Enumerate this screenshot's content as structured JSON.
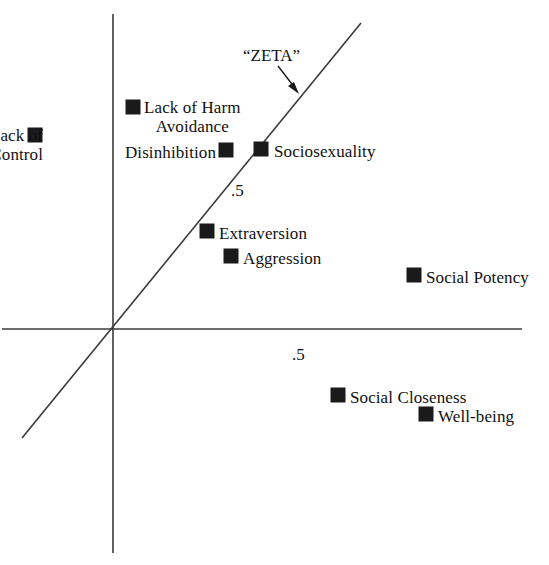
{
  "chart_data": {
    "type": "scatter",
    "title": "",
    "subtitle": "",
    "xlabel": "",
    "ylabel": "",
    "grid": false,
    "legend_position": "none",
    "axes": {
      "style": "crossed-axes-at-origin",
      "origin_px": [
        112,
        329
      ],
      "x_axis_px": [
        [
          2,
          329
        ],
        [
          522,
          329
        ]
      ],
      "y_axis_px": [
        [
          113,
          14
        ],
        [
          113,
          553
        ]
      ],
      "x_ticks": [
        {
          "label": ".5",
          "px": [
            292,
            346
          ]
        }
      ],
      "y_ticks": [
        {
          "label": ".5",
          "px": [
            231,
            182
          ]
        }
      ]
    },
    "annotations": [
      {
        "name": "zeta-axis-line",
        "kind": "line",
        "label": "“ZETA”",
        "from_px": [
          22,
          438
        ],
        "to_px": [
          361,
          23
        ],
        "arrow_from_px": [
          278,
          66
        ],
        "arrow_to_px": [
          299,
          93
        ],
        "label_px": [
          243,
          46
        ]
      }
    ],
    "points": [
      {
        "name": "lack-of-control",
        "label": "Lack of\nControl",
        "marker_px": [
          28,
          128
        ],
        "label_px": [
          43,
          126
        ],
        "label_side": "right",
        "label_align": "right"
      },
      {
        "name": "lack-of-harm-avoidance",
        "label": "Lack of Harm\nAvoidance",
        "marker_px": [
          126,
          100
        ],
        "label_px": [
          144,
          98
        ],
        "label_side": "right",
        "label_align": "center"
      },
      {
        "name": "disinhibition",
        "label": "Disinhibition",
        "marker_px": [
          219,
          143
        ],
        "label_px": [
          216,
          143
        ],
        "label_side": "left",
        "label_align": "right"
      },
      {
        "name": "sociosexuality",
        "label": "Sociosexuality",
        "marker_px": [
          254,
          142
        ],
        "label_px": [
          274,
          142
        ],
        "label_side": "right",
        "label_align": "left"
      },
      {
        "name": "extraversion",
        "label": "Extraversion",
        "marker_px": [
          200,
          224
        ],
        "label_px": [
          219,
          224
        ],
        "label_side": "right",
        "label_align": "left"
      },
      {
        "name": "aggression",
        "label": "Aggression",
        "marker_px": [
          224,
          249
        ],
        "label_px": [
          243,
          249
        ],
        "label_side": "right",
        "label_align": "left"
      },
      {
        "name": "social-potency",
        "label": "Social Potency",
        "marker_px": [
          407,
          268
        ],
        "label_px": [
          426,
          268
        ],
        "label_side": "right",
        "label_align": "left"
      },
      {
        "name": "social-closeness",
        "label": "Social Closeness",
        "marker_px": [
          331,
          388
        ],
        "label_px": [
          350,
          388
        ],
        "label_side": "right",
        "label_align": "left"
      },
      {
        "name": "well-being",
        "label": "Well-being",
        "marker_px": [
          419,
          407
        ],
        "label_px": [
          438,
          407
        ],
        "label_side": "right",
        "label_align": "left"
      }
    ],
    "colors": {
      "marker": "#1a1a1a",
      "axis": "#3a3a3a",
      "text": "#111111",
      "background": "#ffffff"
    }
  }
}
